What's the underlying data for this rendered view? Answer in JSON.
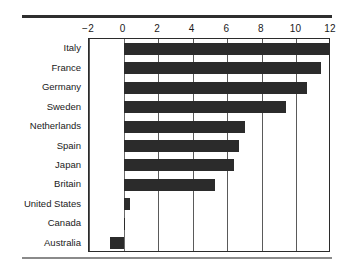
{
  "chart_data": {
    "type": "bar",
    "orientation": "horizontal",
    "title": "",
    "subtitle": "",
    "xlabel": "",
    "ylabel": "",
    "xlim": [
      -2,
      12
    ],
    "ylim": null,
    "grid": true,
    "legend": false,
    "legend_position": "none",
    "bar_color": "#2b2b2b",
    "categories": [
      "Italy",
      "France",
      "Germany",
      "Sweden",
      "Netherlands",
      "Spain",
      "Japan",
      "Britain",
      "United States",
      "Canada",
      "Australia"
    ],
    "values": [
      12.0,
      11.4,
      10.6,
      9.4,
      7.0,
      6.7,
      6.4,
      5.3,
      0.4,
      0.1,
      -0.8
    ],
    "xticks": [
      -2,
      0,
      2,
      4,
      6,
      8,
      10,
      12
    ],
    "xtick_labels": [
      "−2",
      "0",
      "2",
      "4",
      "6",
      "8",
      "10",
      "12"
    ],
    "annotations": []
  },
  "figure": {
    "top_rule_color": "#2e2e2e",
    "bottom_rule_color": "#8a8a8a",
    "frame_color": "#2b2b2b",
    "gridline_color": "#5a5a5a",
    "background": "#ffffff"
  }
}
